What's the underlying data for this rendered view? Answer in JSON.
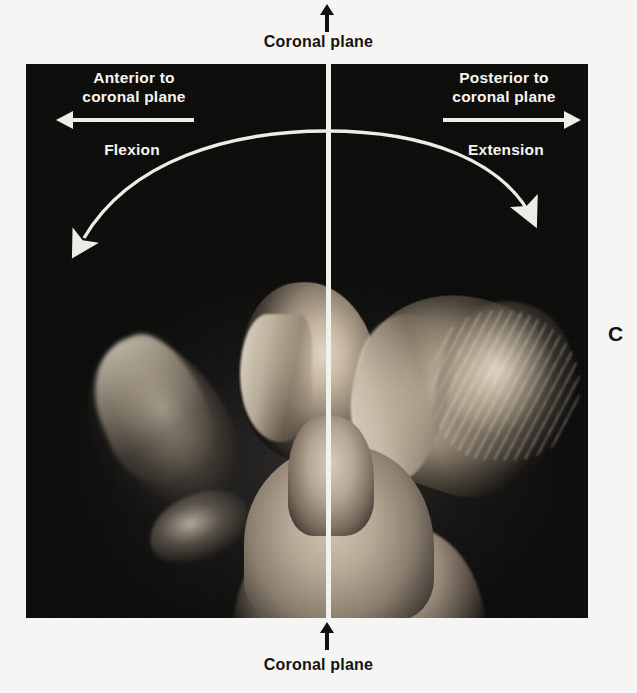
{
  "figure": {
    "letter": "C",
    "background_color": "#f6f5f3",
    "plate_color": "#0a0a0a",
    "line_color": "#f3f1ec",
    "text_color_on_plate": "#f7f5f0",
    "text_color_on_paper": "#141414"
  },
  "captions": {
    "top_plane": "Coronal plane",
    "bottom_plane": "Coronal plane"
  },
  "plate_labels": {
    "anterior": "Anterior to\ncoronal plane",
    "posterior": "Posterior to\ncoronal plane",
    "flexion": "Flexion",
    "extension": "Extension"
  },
  "icons": {
    "top_tick": "up-arrow-icon",
    "bottom_tick": "up-arrow-icon",
    "anterior_arrow": "left-arrow-icon",
    "posterior_arrow": "right-arrow-icon",
    "motion_arc": "double-headed-curved-arrow-icon"
  },
  "photograph": {
    "description": "Composite photograph of a person in profile showing cervical flexion and extension about the coronal plane",
    "positions": [
      "flexed head (chin to chest), anterior to coronal plane",
      "neutral head in profile at the coronal plane",
      "extended head (chin raised), posterior to coronal plane"
    ]
  }
}
